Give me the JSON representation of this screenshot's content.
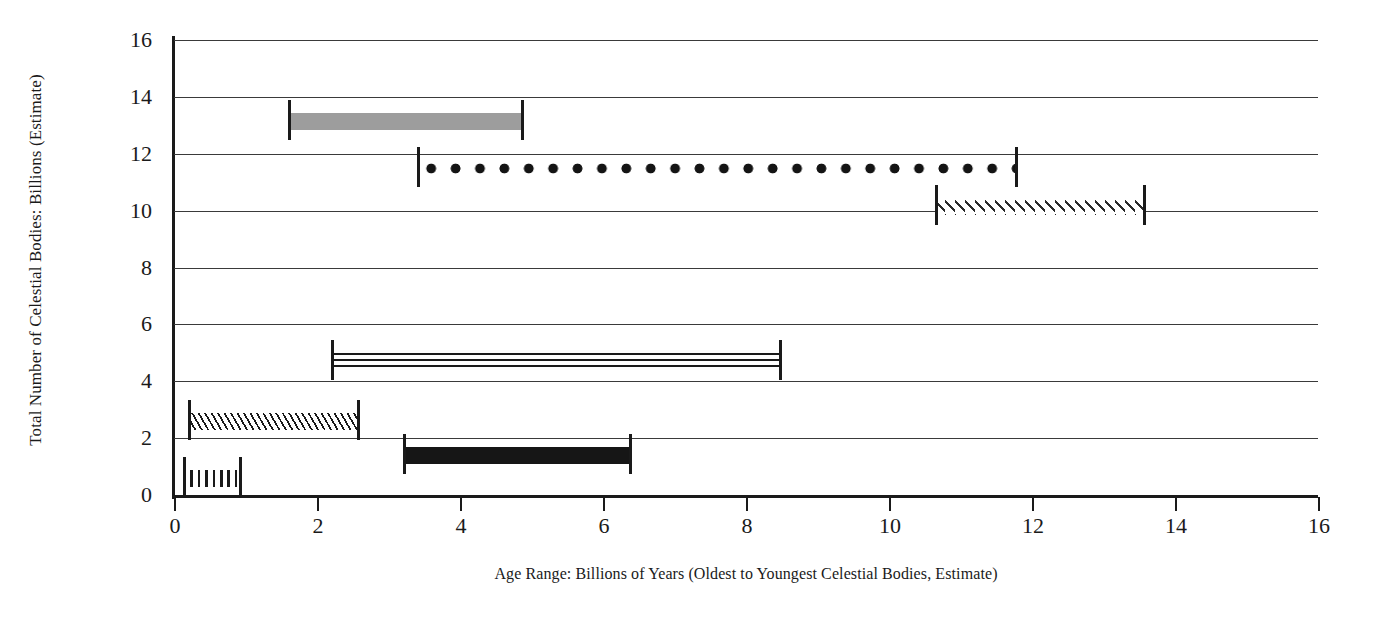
{
  "chart_data": {
    "type": "bar",
    "title": "",
    "subtitle": "",
    "xlabel": "Age Range: Billions of Years (Oldest to Youngest Celestial Bodies, Estimate)",
    "ylabel": "Total Number of Celestial Bodies: Billions (Estimate)",
    "xlim": [
      0,
      16
    ],
    "ylim": [
      0,
      16
    ],
    "xticks": [
      0,
      2,
      4,
      6,
      8,
      10,
      12,
      14,
      16
    ],
    "yticks": [
      0,
      2,
      4,
      6,
      8,
      10,
      12,
      14,
      16
    ],
    "xticklabels": [
      "0",
      "2",
      "4",
      "6",
      "8",
      "10",
      "12",
      "14",
      "16"
    ],
    "yticklabels": [
      "0",
      "2",
      "4",
      "6",
      "8",
      "10",
      "12",
      "14",
      "16"
    ],
    "grid": "horizontal",
    "legend": "none",
    "orientation": "horizontal",
    "note": "Each horizontal floating bar spans an age range (x-start to x-end) at a given y count level; bars are drawn with vertical end caps and distinct hatch/fill patterns.",
    "bars": [
      {
        "label": "Range 1",
        "y": 13.3,
        "x_start": 1.6,
        "x_end": 4.9,
        "pattern": "solid-gray",
        "color": "#9d9d9d"
      },
      {
        "label": "Range 2",
        "y": 11.65,
        "x_start": 3.4,
        "x_end": 11.8,
        "pattern": "dots",
        "color": "#141414"
      },
      {
        "label": "Range 3",
        "y": 10.3,
        "x_start": 10.65,
        "x_end": 13.6,
        "pattern": "diamonds",
        "color": "#2a2a2a"
      },
      {
        "label": "Range 4",
        "y": 4.85,
        "x_start": 2.2,
        "x_end": 8.5,
        "pattern": "horizontal-lines",
        "color": "#1a1a1a"
      },
      {
        "label": "Range 5",
        "y": 2.75,
        "x_start": 0.2,
        "x_end": 2.6,
        "pattern": "diagonal-hatch",
        "color": "#1a1a1a"
      },
      {
        "label": "Range 6",
        "y": 1.55,
        "x_start": 3.2,
        "x_end": 6.4,
        "pattern": "solid-black",
        "color": "#161616"
      },
      {
        "label": "Range 7",
        "y": 0.75,
        "x_start": 0.12,
        "x_end": 0.95,
        "pattern": "vertical-lines",
        "color": "#1a1a1a"
      }
    ],
    "axis_color": "#1a1a1a",
    "grid_color": "#3a3a3a",
    "background_color": "#ffffff"
  }
}
